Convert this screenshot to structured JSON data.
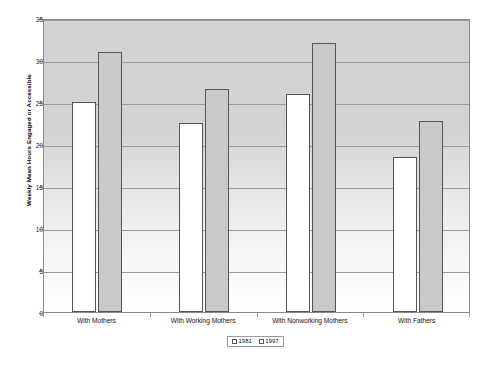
{
  "chart_data": {
    "type": "bar",
    "title": "",
    "subtitle": "",
    "xlabel": "",
    "ylabel": "Weekly Mean Hours Engaged or Accessible",
    "ylim": [
      0,
      35
    ],
    "ytick_labels": [
      "0",
      "5",
      "10",
      "15",
      "20",
      "25",
      "30",
      "35"
    ],
    "ytick_values": [
      0,
      5,
      10,
      15,
      20,
      25,
      30,
      35
    ],
    "grid": true,
    "legend_position": "bottom-center",
    "categories": [
      "With Mothers",
      "With Working Mothers",
      "With Nonworking Mothers",
      "With Fathers"
    ],
    "series": [
      {
        "name": "1981",
        "color": "#ffffff",
        "values": [
          25.0,
          22.5,
          26.0,
          18.5
        ]
      },
      {
        "name": "1997",
        "color": "#c9c9c9",
        "values": [
          31.0,
          26.5,
          32.0,
          22.7
        ]
      }
    ]
  },
  "legend": {
    "entries": [
      {
        "label": "1981"
      },
      {
        "label": "1997"
      }
    ]
  },
  "colors": {
    "plot_top": "#d3d3d3",
    "plot_bottom": "#ffffff",
    "bar_1981": "#ffffff",
    "bar_1997": "#c9c9c9",
    "bar_outline": "#555555",
    "gridline": "#9a9a9a",
    "frame": "#8a8a8a"
  }
}
